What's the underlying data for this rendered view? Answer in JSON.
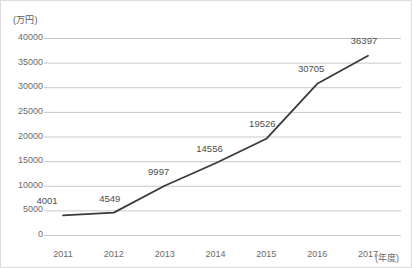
{
  "chart_data": {
    "type": "line",
    "title": "",
    "xlabel": "(年度)",
    "ylabel": "(万円)",
    "categories": [
      "2011",
      "2012",
      "2013",
      "2014",
      "2015",
      "2016",
      "2017"
    ],
    "values": [
      4001,
      4549,
      9997,
      14556,
      19526,
      30705,
      36397
    ],
    "point_labels": [
      "4001",
      "4549",
      "9997",
      "14556",
      "19526",
      "30705",
      "36397"
    ],
    "series": [
      {
        "name": "",
        "values": [
          4001,
          4549,
          9997,
          14556,
          19526,
          30705,
          36397
        ]
      }
    ],
    "ylim": [
      0,
      40000
    ],
    "y_ticks": [
      "0",
      "5000",
      "10000",
      "15000",
      "20000",
      "25000",
      "30000",
      "35000",
      "40000"
    ],
    "y_tick_values": [
      0,
      5000,
      10000,
      15000,
      20000,
      25000,
      30000,
      35000,
      40000
    ],
    "x_ticks": [
      "2011",
      "2012",
      "2013",
      "2014",
      "2015",
      "2016",
      "2017"
    ],
    "grid": "horizontal",
    "legend": "none",
    "markers": false,
    "colors": {
      "line": "#3a3a3a",
      "grid": "#c9c9c9",
      "axis_text": "#6a6a6a",
      "label_text": "#4d4d4d",
      "background": "#ffffff",
      "border": "#dcdcdc"
    }
  }
}
